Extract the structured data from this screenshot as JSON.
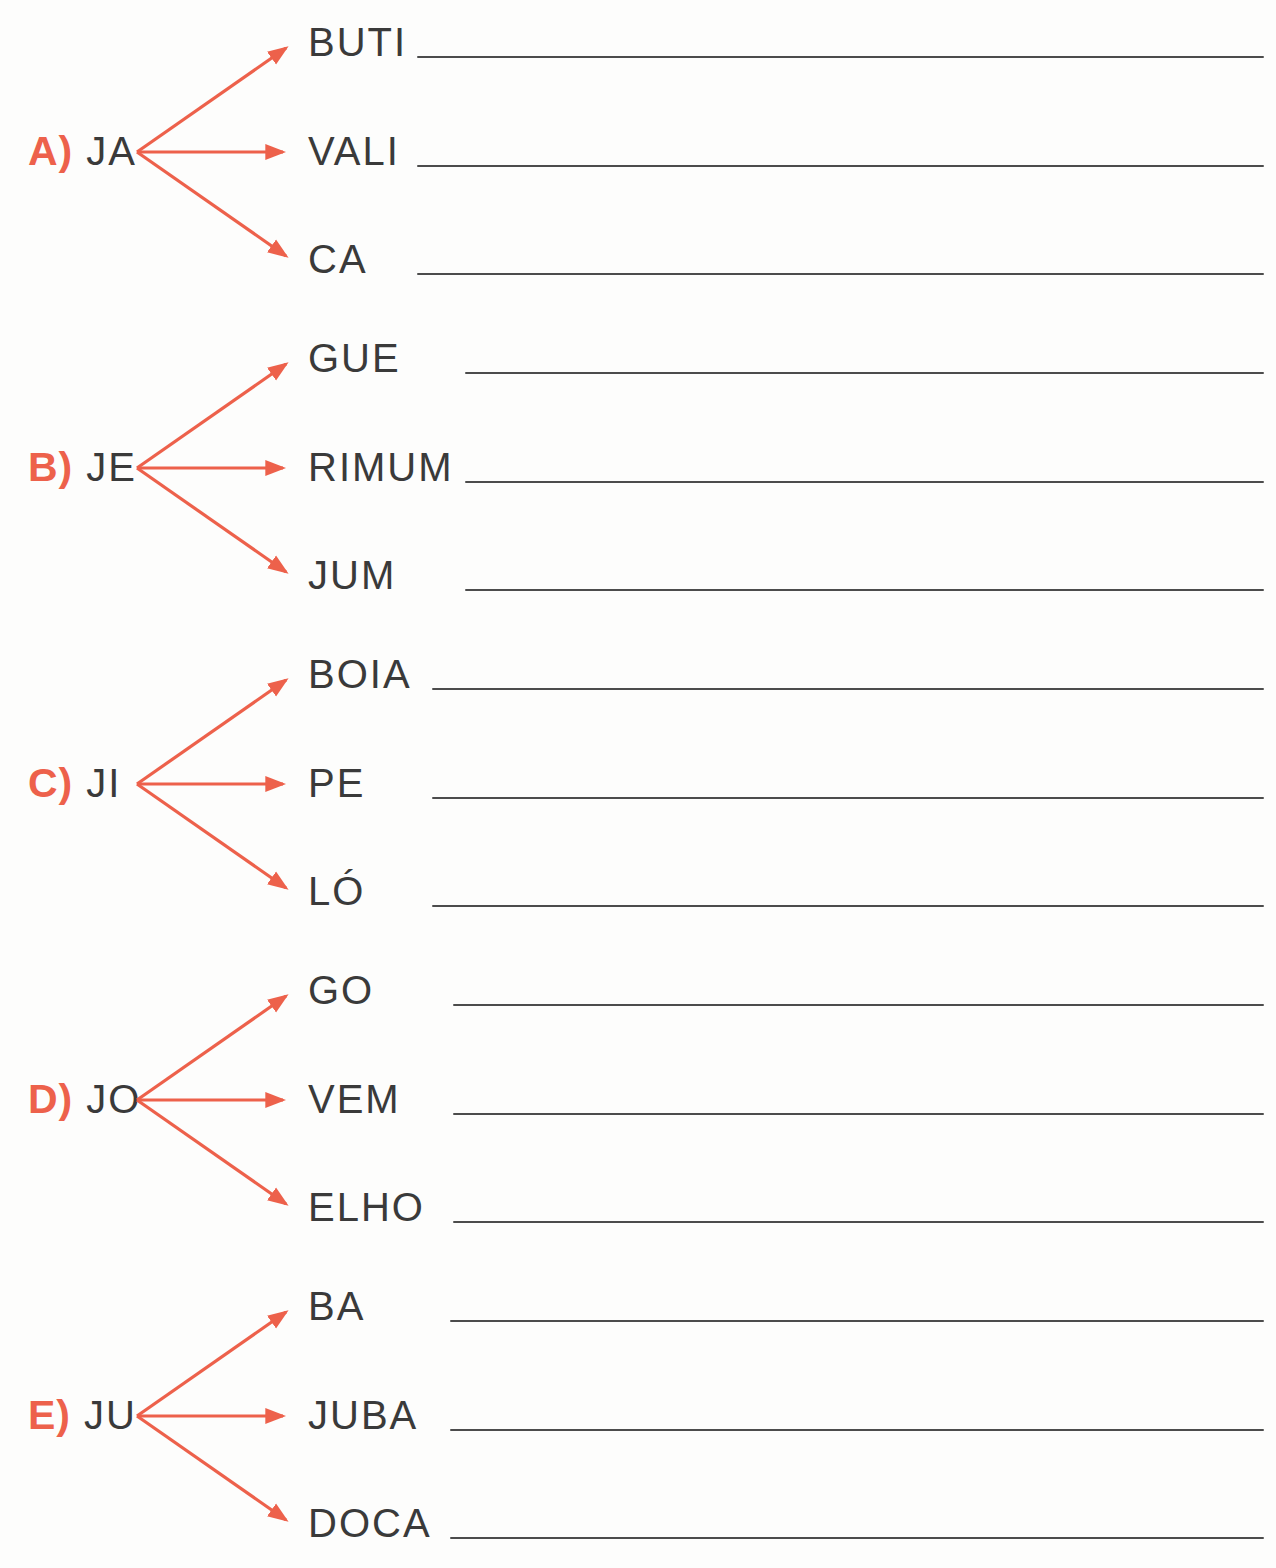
{
  "worksheet": {
    "type": "syllable-combination-exercise",
    "accent_color": "#ED614B",
    "ink_color": "#3A3A3A",
    "rule_color": "#4C4C4C",
    "background_color": "#FDFDFC",
    "groups": [
      {
        "label": "A)",
        "syllable": "JA",
        "branches": [
          {
            "fragment": "BUTI",
            "answer": ""
          },
          {
            "fragment": "VALI",
            "answer": ""
          },
          {
            "fragment": "CA",
            "answer": ""
          }
        ]
      },
      {
        "label": "B)",
        "syllable": "JE",
        "branches": [
          {
            "fragment": "GUE",
            "answer": ""
          },
          {
            "fragment": "RIMUM",
            "answer": ""
          },
          {
            "fragment": "JUM",
            "answer": ""
          }
        ]
      },
      {
        "label": "C)",
        "syllable": "JI",
        "branches": [
          {
            "fragment": "BOIA",
            "answer": ""
          },
          {
            "fragment": "PE",
            "answer": ""
          },
          {
            "fragment": "LÓ",
            "answer": ""
          }
        ]
      },
      {
        "label": "D)",
        "syllable": "JO",
        "branches": [
          {
            "fragment": "GO",
            "answer": ""
          },
          {
            "fragment": "VEM",
            "answer": ""
          },
          {
            "fragment": "ELHO",
            "answer": ""
          }
        ]
      },
      {
        "label": "E)",
        "syllable": "JU",
        "branches": [
          {
            "fragment": "BA",
            "answer": ""
          },
          {
            "fragment": "JUBA",
            "answer": ""
          },
          {
            "fragment": "DOCA",
            "answer": ""
          }
        ]
      }
    ]
  }
}
